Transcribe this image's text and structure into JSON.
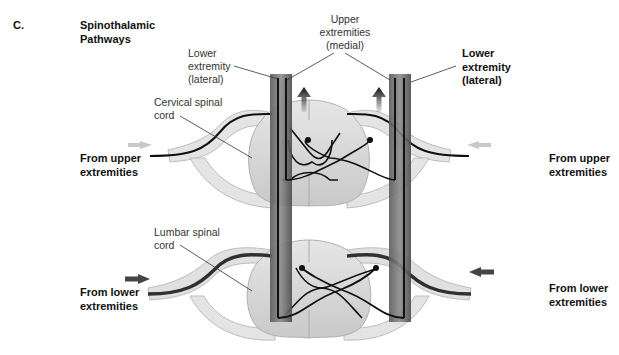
{
  "figure": {
    "panel_letter": "C.",
    "title_line1": "Spinothalamic",
    "title_line2": "Pathways"
  },
  "labels": {
    "lower_extremity_lateral_left": [
      "Lower",
      "extremity",
      "(lateral)"
    ],
    "upper_extremities_medial": [
      "Upper",
      "extremities",
      "(medial)"
    ],
    "lower_extremity_lateral_right": [
      "Lower",
      "extremity",
      "(lateral)"
    ],
    "cervical_spinal_cord": [
      "Cervical spinal",
      "cord"
    ],
    "lumbar_spinal_cord": [
      "Lumbar spinal",
      "cord"
    ],
    "from_upper_left": [
      "From upper",
      "extremities"
    ],
    "from_upper_right": [
      "From upper",
      "extremities"
    ],
    "from_lower_left": [
      "From lower",
      "extremities"
    ],
    "from_lower_right": [
      "From lower",
      "extremities"
    ]
  },
  "colors": {
    "background": "#ffffff",
    "tract_dark": "#3a3a3a",
    "fiber": "#111111",
    "cord_fill": "#dcdcdc",
    "nerve_fill": "#e4e4e4",
    "upper_input_arrow": "#c8c8c8",
    "lower_input_arrow": "#444444"
  }
}
